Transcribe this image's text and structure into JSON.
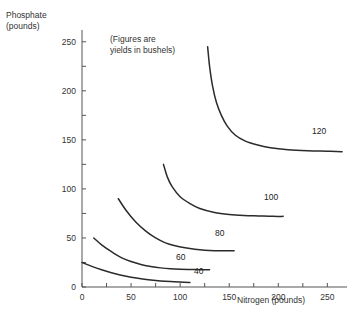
{
  "chart_data": {
    "type": "line",
    "title": "",
    "subtitle": "",
    "annotation": "(Figures are\nyields in bushels)",
    "xlabel": "Nitrogen (pounds)",
    "ylabel": "Phosphate\n(pounds)",
    "ylabel_line1": "Phosphate",
    "ylabel_line2": "(pounds)",
    "xlim": [
      0,
      270
    ],
    "ylim": [
      0,
      262
    ],
    "grid": false,
    "legend": "inline-curve-labels",
    "xticks": [
      0,
      25,
      50,
      75,
      100,
      125,
      150,
      175,
      200,
      225,
      250
    ],
    "xtick_labels": [
      "0",
      "50",
      "100",
      "150",
      "200",
      "250"
    ],
    "xtick_label_values": [
      0,
      50,
      100,
      150,
      200,
      250
    ],
    "yticks": [
      0,
      25,
      50,
      75,
      100,
      125,
      150,
      175,
      200,
      225,
      250
    ],
    "ytick_labels": [
      "0",
      "50",
      "100",
      "150",
      "200",
      "250"
    ],
    "ytick_label_values": [
      0,
      50,
      100,
      150,
      200,
      250
    ],
    "series": [
      {
        "name": "40",
        "label": "40",
        "points": [
          [
            0,
            25
          ],
          [
            10,
            21
          ],
          [
            20,
            17.5
          ],
          [
            30,
            14.5
          ],
          [
            40,
            12
          ],
          [
            50,
            10
          ],
          [
            60,
            8.5
          ],
          [
            70,
            7.2
          ],
          [
            80,
            6.2
          ],
          [
            90,
            5.5
          ],
          [
            100,
            5
          ],
          [
            110,
            4.6
          ]
        ]
      },
      {
        "name": "60",
        "label": "60",
        "points": [
          [
            12,
            50
          ],
          [
            20,
            43
          ],
          [
            30,
            36
          ],
          [
            40,
            30
          ],
          [
            50,
            26
          ],
          [
            60,
            23
          ],
          [
            70,
            21
          ],
          [
            80,
            19.5
          ],
          [
            90,
            18.5
          ],
          [
            100,
            18
          ],
          [
            110,
            17.8
          ],
          [
            120,
            17.7
          ],
          [
            130,
            17.7
          ]
        ]
      },
      {
        "name": "80",
        "label": "80",
        "points": [
          [
            37,
            90
          ],
          [
            45,
            78
          ],
          [
            55,
            66
          ],
          [
            65,
            57
          ],
          [
            75,
            50
          ],
          [
            85,
            45
          ],
          [
            95,
            42
          ],
          [
            105,
            40
          ],
          [
            115,
            38.5
          ],
          [
            125,
            37.5
          ],
          [
            135,
            37
          ],
          [
            145,
            37
          ],
          [
            155,
            37
          ]
        ]
      },
      {
        "name": "100",
        "label": "100",
        "points": [
          [
            83,
            125
          ],
          [
            87,
            112
          ],
          [
            92,
            102
          ],
          [
            100,
            92
          ],
          [
            110,
            85
          ],
          [
            120,
            80
          ],
          [
            135,
            76
          ],
          [
            150,
            74
          ],
          [
            165,
            73
          ],
          [
            180,
            72.5
          ],
          [
            195,
            72
          ],
          [
            205,
            72
          ]
        ]
      },
      {
        "name": "120",
        "label": "120",
        "points": [
          [
            128,
            245
          ],
          [
            130,
            225
          ],
          [
            133,
            205
          ],
          [
            137,
            188
          ],
          [
            142,
            175
          ],
          [
            148,
            164
          ],
          [
            156,
            155
          ],
          [
            166,
            149
          ],
          [
            178,
            145
          ],
          [
            192,
            142
          ],
          [
            210,
            140
          ],
          [
            230,
            139
          ],
          [
            250,
            138.5
          ],
          [
            265,
            138
          ]
        ]
      }
    ],
    "curve_label_positions": [
      {
        "name": "40",
        "x": 194,
        "y": 266
      },
      {
        "name": "60",
        "x": 176,
        "y": 252
      },
      {
        "name": "80",
        "x": 215,
        "y": 228
      },
      {
        "name": "100",
        "x": 264,
        "y": 192
      },
      {
        "name": "120",
        "x": 312,
        "y": 126
      }
    ],
    "line_color": "#2b2b2b",
    "axis_color": "#555555",
    "background": "#ffffff"
  }
}
